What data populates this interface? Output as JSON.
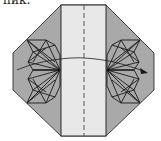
{
  "caption": "пик.",
  "colors": {
    "gray_fill": "#a9a9a9",
    "light_fill": "#e8e8e8",
    "stroke": "#1a1a1a",
    "background": "#ffffff"
  },
  "diagram": {
    "type": "origami-folding-step",
    "elements": [
      "octagon-base",
      "center-strip",
      "dashed-valley-fold-line",
      "left-crease-fan",
      "right-crease-fan",
      "curved-arrow-right"
    ]
  }
}
